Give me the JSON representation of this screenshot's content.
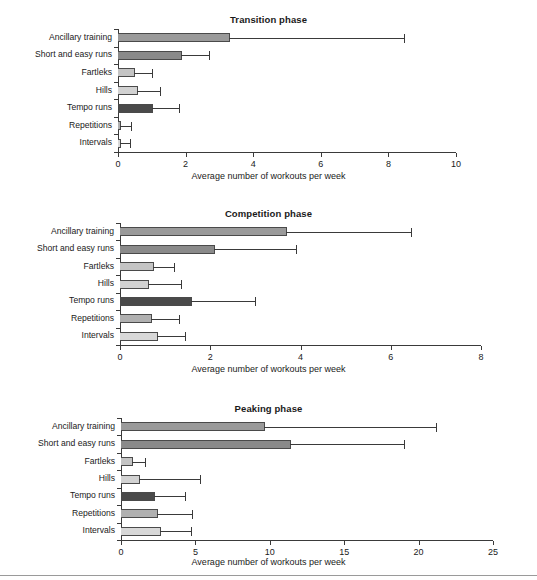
{
  "figure": {
    "axis_caption": "Average number of workouts per week",
    "categories": [
      "Ancillary training",
      "Short and easy runs",
      "Fartleks",
      "Hills",
      "Tempo runs",
      "Repetitions",
      "Intervals"
    ],
    "bar_colors": [
      "#9a9a9a",
      "#8a8a8a",
      "#c4c4c4",
      "#d2d2d2",
      "#4a4a4a",
      "#b0b0b0",
      "#d8d8d8"
    ]
  },
  "chart_data": [
    {
      "type": "bar",
      "orientation": "horizontal",
      "title": "Transition phase",
      "xlabel": "Average number of workouts per week",
      "ylabel": "",
      "xlim": [
        0,
        10
      ],
      "xticks": [
        0,
        2,
        4,
        6,
        8,
        10
      ],
      "xticklabels": [
        "0",
        "2",
        "4",
        "6",
        "8",
        "10"
      ],
      "grid": false,
      "legend": "none",
      "categories": [
        "Ancillary training",
        "Short and easy runs",
        "Fartleks",
        "Hills",
        "Tempo runs",
        "Repetitions",
        "Intervals"
      ],
      "values": [
        3.3,
        1.9,
        0.5,
        0.6,
        1.05,
        0.1,
        0.1
      ],
      "error_upper": [
        8.45,
        2.7,
        1.0,
        1.25,
        1.8,
        0.38,
        0.35
      ]
    },
    {
      "type": "bar",
      "orientation": "horizontal",
      "title": "Competition phase",
      "xlabel": "Average number of workouts per week",
      "ylabel": "",
      "xlim": [
        0,
        8
      ],
      "xticks": [
        0,
        2,
        4,
        6,
        8
      ],
      "xticklabels": [
        "0",
        "2",
        "4",
        "6",
        "8"
      ],
      "grid": false,
      "legend": "none",
      "categories": [
        "Ancillary training",
        "Short and easy runs",
        "Fartleks",
        "Hills",
        "Tempo runs",
        "Repetitions",
        "Intervals"
      ],
      "values": [
        3.7,
        2.1,
        0.75,
        0.65,
        1.6,
        0.72,
        0.85
      ],
      "error_upper": [
        6.45,
        3.9,
        1.2,
        1.35,
        3.0,
        1.3,
        1.45
      ]
    },
    {
      "type": "bar",
      "orientation": "horizontal",
      "title": "Peaking phase",
      "xlabel": "Average number of workouts per week",
      "ylabel": "",
      "xlim": [
        0,
        25
      ],
      "xticks": [
        0,
        5,
        10,
        15,
        20,
        25
      ],
      "xticklabels": [
        "0",
        "5",
        "10",
        "15",
        "20",
        "25"
      ],
      "grid": false,
      "legend": "none",
      "categories": [
        "Ancillary training",
        "Short and easy runs",
        "Fartleks",
        "Hills",
        "Tempo runs",
        "Repetitions",
        "Intervals"
      ],
      "values": [
        9.7,
        11.4,
        0.8,
        1.3,
        2.3,
        2.5,
        2.7
      ],
      "error_upper": [
        21.2,
        19.0,
        1.6,
        5.3,
        4.3,
        4.8,
        4.7
      ]
    }
  ]
}
